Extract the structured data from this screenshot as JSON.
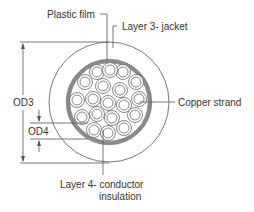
{
  "diagram": {
    "type": "cable cross-section",
    "labels": {
      "plastic_film": "Plastic film",
      "jacket": "Layer 3- jacket",
      "copper_strand": "Copper strand",
      "insulation_line1": "Layer 4- conductor",
      "insulation_line2": "insulation",
      "od3": "OD3",
      "od4": "OD4"
    },
    "colors": {
      "line": "#555555",
      "ring": "#8a8a8a",
      "text": "#333333",
      "background": "#ffffff"
    },
    "geometry": {
      "outer_jacket": {
        "cx": 109,
        "cy": 102,
        "r": 60
      },
      "film_ring": {
        "cx": 109,
        "cy": 102,
        "r": 42
      },
      "strand_count": 24
    }
  }
}
